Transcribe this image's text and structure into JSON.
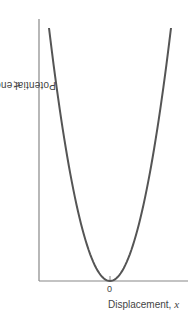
{
  "chart_data": {
    "type": "line",
    "title": "",
    "xlabel": "Displacement, x",
    "ylabel": "Potential energy, V",
    "xlabel_text": "Displacement,",
    "xlabel_var": "x",
    "ylabel_text": "Potential energy,",
    "ylabel_var": "V",
    "x_ticks": [
      "0"
    ],
    "y_ticks": [],
    "grid": false,
    "legend": null,
    "series": [
      {
        "name": "V = ½kx² (parabola)",
        "x": [
          -1.0,
          -0.75,
          -0.5,
          -0.25,
          0,
          0.25,
          0.5,
          0.75,
          1.0
        ],
        "values": [
          1.0,
          0.5625,
          0.25,
          0.0625,
          0,
          0.0625,
          0.25,
          0.5625,
          1.0
        ],
        "color": "#555555"
      }
    ],
    "xlim": [
      -1.2,
      1.3
    ],
    "ylim": [
      0,
      1.03
    ]
  },
  "style": {
    "axis_color": "#888888",
    "curve_color": "#555555",
    "text_color": "#444444"
  }
}
